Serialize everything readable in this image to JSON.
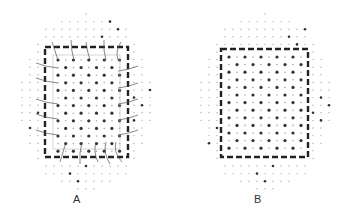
{
  "panels": [
    {
      "id": "A",
      "label": "A",
      "label_pos": [
        78,
        201
      ],
      "box": {
        "x": 45,
        "y": 47,
        "w": 83,
        "h": 110
      },
      "inner_grid": {
        "x0": 58,
        "y0": 60,
        "dx": 7.7,
        "dy": 7.6,
        "cols": 9,
        "rows": 13
      },
      "outer_cloud": {
        "cx": 86,
        "cy": 102,
        "rx": 72,
        "ry": 88
      },
      "has_connectors": true
    },
    {
      "id": "B",
      "label": "B",
      "label_pos": [
        258,
        201
      ],
      "box": {
        "x": 221,
        "y": 49,
        "w": 87,
        "h": 108
      },
      "inner_grid": {
        "x0": 229,
        "y0": 57,
        "dx": 8.0,
        "dy": 7.6,
        "cols": 10,
        "rows": 13
      },
      "outer_cloud": {
        "cx": 265,
        "cy": 102,
        "rx": 72,
        "ry": 88
      },
      "has_connectors": false
    }
  ],
  "colors": {
    "border": "#222222",
    "dot_dark": "#333333",
    "dot_light": "#aaaaaa",
    "connector": "#555555"
  }
}
